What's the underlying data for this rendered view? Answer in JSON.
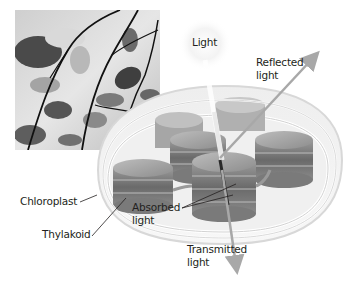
{
  "figure": {
    "photo": {
      "subject": "leaves-on-branches",
      "tone": "grayscale"
    },
    "light_source": {
      "icon": "sunburst-icon",
      "label": "Light"
    },
    "labels": {
      "light": "Light",
      "reflected_line1": "Reflected",
      "reflected_line2": "light",
      "chloroplast": "Chloroplast",
      "thylakoid": "Thylakoid",
      "absorbed_line1": "Absorbed",
      "absorbed_line2": "light",
      "transmitted_line1": "Transmitted",
      "transmitted_line2": "light"
    },
    "colors": {
      "text": "#231f20",
      "arrow": "#a8a8a8",
      "stack_dark": "#6e6e6e",
      "stack_light": "#c8c8c8",
      "membrane": "#e6e6e6"
    }
  }
}
